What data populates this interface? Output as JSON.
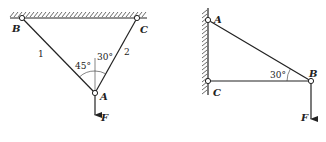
{
  "figure_left": {
    "joints": [
      {
        "name": "B",
        "x": 22,
        "y": 18
      },
      {
        "name": "C",
        "x": 137,
        "y": 18
      },
      {
        "name": "A",
        "x": 95,
        "y": 93
      }
    ],
    "members": [
      {
        "label": "1",
        "from": "B",
        "to": "A"
      },
      {
        "label": "2",
        "from": "C",
        "to": "A"
      }
    ],
    "angles": [
      {
        "label": "45°",
        "between": "member 1 and vertical"
      },
      {
        "label": "30°",
        "between": "member 2 and vertical"
      }
    ],
    "force": {
      "label": "F",
      "at": "A",
      "direction": "down"
    },
    "support": "ceiling"
  },
  "figure_right": {
    "joints": [
      {
        "name": "A",
        "x": 208,
        "y": 20
      },
      {
        "name": "C",
        "x": 208,
        "y": 81
      },
      {
        "name": "B",
        "x": 311,
        "y": 81
      }
    ],
    "members": [
      {
        "from": "A",
        "to": "B"
      },
      {
        "from": "C",
        "to": "B"
      }
    ],
    "angles": [
      {
        "label": "30°",
        "between": "AB and CB"
      }
    ],
    "force": {
      "label": "F",
      "at": "B",
      "direction": "down"
    },
    "support": "wall"
  },
  "labels": {
    "left_B": "B",
    "left_C": "C",
    "left_A": "A",
    "left_F": "F",
    "left_member1": "1",
    "left_member2": "2",
    "left_angle45": "45°",
    "left_angle30": "30°",
    "right_A": "A",
    "right_B": "B",
    "right_C": "C",
    "right_F": "F",
    "right_angle30": "30°"
  }
}
